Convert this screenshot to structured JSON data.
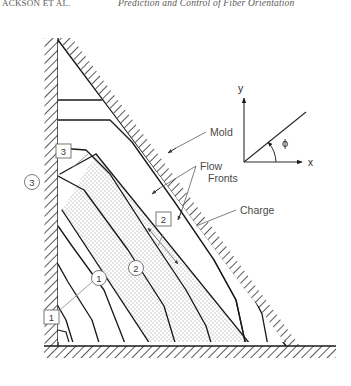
{
  "running_head": {
    "left": "ACKSON ET AL.",
    "right": "Prediction and Control of Fiber Orientation"
  },
  "figure": {
    "callouts": [
      {
        "id": "mold",
        "text": "Mold"
      },
      {
        "id": "flow-fronts",
        "text": "Flow"
      },
      {
        "id": "flow-fronts2",
        "text": "Fronts"
      },
      {
        "id": "charge",
        "text": "Charge"
      }
    ],
    "box_labels": [
      {
        "id": "box-1",
        "text": "1"
      },
      {
        "id": "box-2",
        "text": "2"
      },
      {
        "id": "box-3",
        "text": "3"
      }
    ],
    "circle_labels": [
      {
        "id": "circle-1",
        "text": "1"
      },
      {
        "id": "circle-2",
        "text": "2"
      },
      {
        "id": "circle-3",
        "text": "3"
      }
    ],
    "axes_inset": {
      "y_label": "y",
      "x_label": "x",
      "angle_label": "ϕ"
    }
  },
  "caption": {
    "text": ""
  },
  "colors": {
    "ink": "#1a1a1a",
    "wall_hatch": "#222222",
    "charge_stipple": "#9a9a9a",
    "leader": "#8a8a88",
    "label_text": "#5a5a58",
    "paper": "#ffffff"
  }
}
